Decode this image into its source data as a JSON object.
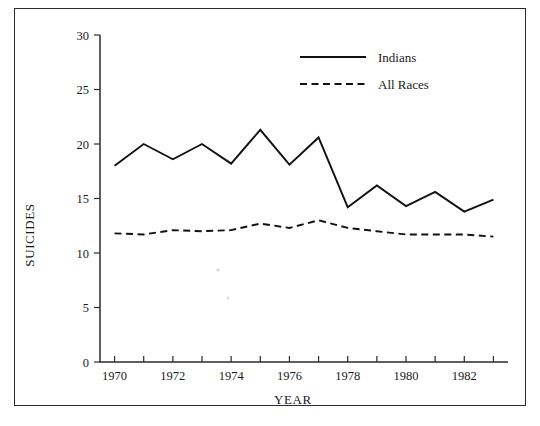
{
  "chart_data": {
    "type": "line",
    "title": "",
    "xlabel": "YEAR",
    "ylabel": "SUICIDES",
    "xlim": [
      1969.5,
      1983.5
    ],
    "ylim": [
      0,
      30
    ],
    "grid": false,
    "legend_position": "top-center-right",
    "x": [
      1970,
      1971,
      1972,
      1973,
      1974,
      1975,
      1976,
      1977,
      1978,
      1979,
      1980,
      1981,
      1982,
      1983
    ],
    "x_tick_values": [
      1970,
      1971,
      1972,
      1973,
      1974,
      1975,
      1976,
      1977,
      1978,
      1979,
      1980,
      1981,
      1982,
      1983
    ],
    "x_tick_labels": [
      "1970",
      "",
      "1972",
      "",
      "1974",
      "",
      "1976",
      "",
      "1978",
      "",
      "1980",
      "",
      "1982",
      ""
    ],
    "y_tick_values": [
      0,
      5,
      10,
      15,
      20,
      25,
      30
    ],
    "y_tick_labels": [
      "0",
      "5",
      "10",
      "15",
      "20",
      "25",
      "30"
    ],
    "series": [
      {
        "name": "Indians",
        "style": "solid",
        "color": "#111111",
        "values": [
          18.0,
          20.0,
          18.6,
          20.0,
          18.2,
          21.3,
          18.1,
          20.6,
          14.2,
          16.2,
          14.3,
          15.6,
          13.8,
          14.9
        ]
      },
      {
        "name": "All Races",
        "style": "dashed",
        "color": "#111111",
        "values": [
          11.8,
          11.7,
          12.1,
          12.0,
          12.1,
          12.7,
          12.3,
          13.0,
          12.3,
          12.0,
          11.7,
          11.7,
          11.7,
          11.5
        ]
      }
    ]
  },
  "legend": {
    "entries": [
      {
        "label": "Indians",
        "style": "solid"
      },
      {
        "label": "All Races",
        "style": "dashed"
      }
    ]
  },
  "axes": {
    "y_title": "SUICIDES",
    "x_title": "YEAR"
  }
}
